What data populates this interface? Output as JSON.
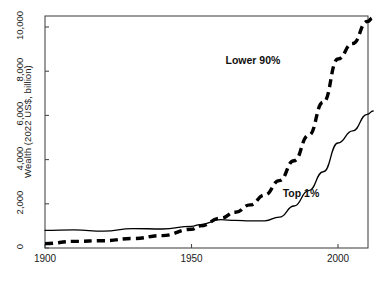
{
  "chart_data": {
    "type": "line",
    "title": "",
    "xlabel": "",
    "ylabel": "Wealth (2022 US$, billion)",
    "xlim": [
      1900,
      2012
    ],
    "ylim": [
      0,
      11000
    ],
    "xticks": [
      "1900",
      "1950",
      "2000"
    ],
    "xtick_values": [
      1900,
      1950,
      2000
    ],
    "yticks": [
      "0",
      "2,000",
      "4,000",
      "6,000",
      "8,000",
      "10,000"
    ],
    "ytick_values": [
      0,
      2000,
      4000,
      6000,
      8000,
      10000
    ],
    "grid": false,
    "legend_position": "inline-annotations",
    "series": [
      {
        "name": "Lower 90%",
        "style": "dashed",
        "color": "#000000",
        "label_x": 1978,
        "label_y": 8450,
        "x": [
          1900,
          1910,
          1920,
          1930,
          1940,
          1950,
          1953,
          1960,
          1965,
          1970,
          1975,
          1980,
          1985,
          1990,
          1995,
          2000,
          2005,
          2010,
          2012
        ],
        "values": [
          200,
          300,
          330,
          430,
          560,
          850,
          1000,
          1350,
          1620,
          1950,
          2400,
          3050,
          3950,
          5100,
          6600,
          8550,
          9250,
          10250,
          10420
        ]
      },
      {
        "name": "Top 1%",
        "style": "solid",
        "color": "#000000",
        "label_x": 1990,
        "label_y": 2450,
        "x": [
          1900,
          1910,
          1920,
          1930,
          1940,
          1950,
          1953,
          1960,
          1965,
          1970,
          1975,
          1980,
          1985,
          1990,
          1995,
          2000,
          2005,
          2010,
          2012
        ],
        "values": [
          800,
          820,
          760,
          880,
          860,
          980,
          1060,
          1280,
          1250,
          1230,
          1230,
          1400,
          1900,
          2600,
          3450,
          4750,
          5300,
          6050,
          6200
        ]
      }
    ]
  },
  "axis": {
    "ylabel": "Wealth (2022 US$, billion)"
  }
}
